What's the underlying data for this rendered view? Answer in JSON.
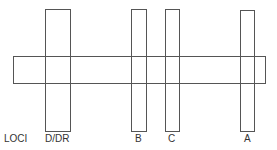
{
  "diagram": {
    "row_label": "LOCI",
    "horizontal_bar": {
      "name": "chromosome-segment",
      "x": 13,
      "y": 56,
      "w": 253,
      "h": 28
    },
    "loci": [
      {
        "label": "D/DR",
        "x": 45,
        "y": 9,
        "w": 26,
        "h": 123,
        "label_x": 45
      },
      {
        "label": "B",
        "x": 131,
        "y": 9,
        "w": 16,
        "h": 123,
        "label_x": 134
      },
      {
        "label": "C",
        "x": 165,
        "y": 9,
        "w": 15,
        "h": 123,
        "label_x": 168
      },
      {
        "label": "A",
        "x": 240,
        "y": 10,
        "w": 15,
        "h": 122,
        "label_x": 243
      }
    ],
    "stroke_color": "#555555",
    "text_color": "#333333"
  }
}
